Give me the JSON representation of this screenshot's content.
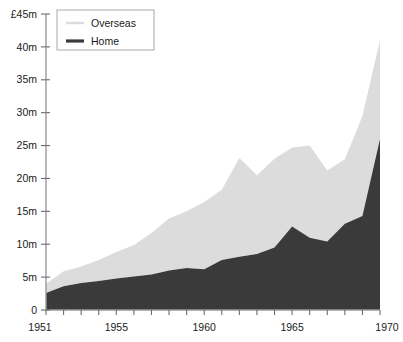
{
  "chart_data": {
    "type": "area",
    "stacked": true,
    "title": "",
    "subtitle": "",
    "xlabel": "",
    "ylabel": "",
    "y_axis_caption": "£45m",
    "xlim": [
      1951,
      1970
    ],
    "ylim": [
      0,
      45
    ],
    "grid": false,
    "legend_position": "top-left",
    "x": [
      1951,
      1952,
      1953,
      1954,
      1955,
      1956,
      1957,
      1958,
      1959,
      1960,
      1961,
      1962,
      1963,
      1964,
      1965,
      1966,
      1967,
      1968,
      1969,
      1970
    ],
    "categories": [
      "1951",
      "1952",
      "1953",
      "1954",
      "1955",
      "1956",
      "1957",
      "1958",
      "1959",
      "1960",
      "1961",
      "1962",
      "1963",
      "1964",
      "1965",
      "1966",
      "1967",
      "1968",
      "1969",
      "1970"
    ],
    "series": [
      {
        "name": "Home",
        "color": "#3a3a3a",
        "values": [
          2.6,
          3.6,
          4.1,
          4.4,
          4.8,
          5.1,
          5.4,
          6.0,
          6.4,
          6.2,
          7.6,
          8.1,
          8.5,
          9.5,
          12.7,
          11.0,
          10.4,
          13.1,
          14.3,
          26.0
        ]
      },
      {
        "name": "Overseas",
        "color": "#dcdcdc",
        "values": [
          1.4,
          2.3,
          2.5,
          3.2,
          4.0,
          4.8,
          6.3,
          7.9,
          8.6,
          10.2,
          10.7,
          15.0,
          12.0,
          13.5,
          12.0,
          14.0,
          10.8,
          9.8,
          15.2,
          15.0
        ]
      }
    ],
    "totals": [
      4.0,
      5.9,
      6.6,
      7.6,
      8.8,
      9.9,
      11.7,
      13.9,
      15.0,
      16.4,
      18.3,
      23.1,
      20.5,
      23.0,
      24.7,
      25.0,
      21.2,
      22.9,
      29.5,
      41.0
    ],
    "y_ticks": [
      0,
      5,
      10,
      15,
      20,
      25,
      30,
      35,
      40,
      45
    ],
    "y_tick_labels": [
      "0",
      "5m",
      "10m",
      "15m",
      "20m",
      "25m",
      "30m",
      "35m",
      "40m",
      "£45m"
    ],
    "x_ticks": [
      1951,
      1952,
      1953,
      1954,
      1955,
      1956,
      1957,
      1958,
      1959,
      1960,
      1961,
      1962,
      1963,
      1964,
      1965,
      1966,
      1967,
      1968,
      1969,
      1970
    ],
    "x_tick_labels_shown": [
      "1951",
      "1955",
      "1960",
      "1965",
      "1970"
    ],
    "legend": [
      {
        "label": "Overseas",
        "color": "#dcdcdc"
      },
      {
        "label": "Home",
        "color": "#3a3a3a"
      }
    ],
    "colors": {
      "overseas": "#dcdcdc",
      "home": "#3a3a3a",
      "axis": "#9a9a9a",
      "text": "#1b1b1b",
      "background": "#ffffff"
    }
  }
}
